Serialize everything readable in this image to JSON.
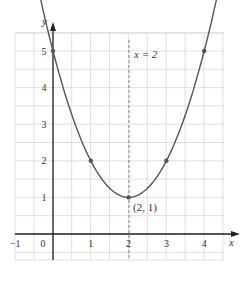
{
  "chart_data": {
    "type": "line",
    "title": "",
    "xlabel": "x",
    "ylabel": "y",
    "xlim": [
      -1,
      4.5
    ],
    "ylim": [
      -0.7,
      5.5
    ],
    "grid": true,
    "x_ticks": [
      "-1",
      "0",
      "1",
      "2",
      "3",
      "4"
    ],
    "y_ticks": [
      "1",
      "2",
      "3",
      "4",
      "5"
    ],
    "series": [
      {
        "name": "y = (x - 2)^2 + 1",
        "x": [
          0,
          1,
          2,
          3,
          4
        ],
        "y": [
          5,
          2,
          1,
          2,
          5
        ]
      }
    ],
    "marked_points": [
      {
        "x": 0,
        "y": 5
      },
      {
        "x": 1,
        "y": 2
      },
      {
        "x": 2,
        "y": 1
      },
      {
        "x": 3,
        "y": 2
      },
      {
        "x": 4,
        "y": 5
      }
    ],
    "annotations": [
      {
        "text": "x = 2",
        "type": "dashed-vertical-line",
        "x": 2
      },
      {
        "text": "(2, 1)",
        "type": "point-label",
        "x": 2,
        "y": 1
      }
    ]
  },
  "labels": {
    "x_axis": "x",
    "y_axis": "y",
    "axis_line": "x = 2",
    "vertex": "(2, 1)",
    "x_ticks": [
      "−1",
      "0",
      "1",
      "2",
      "3",
      "4"
    ],
    "y_ticks": [
      "1",
      "2",
      "3",
      "4",
      "5"
    ]
  },
  "colors": {
    "grid": "#d8d8d8",
    "axis": "#222222",
    "curve": "#555555",
    "point": "#555555"
  }
}
